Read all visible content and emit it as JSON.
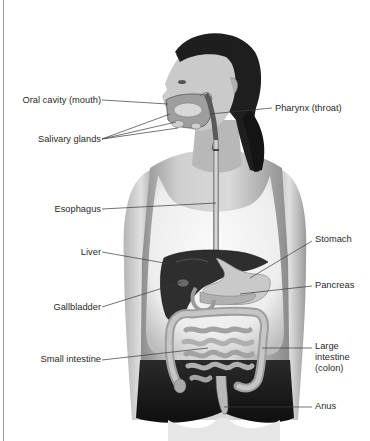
{
  "diagram": {
    "title": "",
    "colors": {
      "background": "#ffffff",
      "text": "#2a2a2a",
      "leader_line": "#3a3a3a",
      "skin": "#c9c9c9",
      "hair": "#1e1e1e",
      "tank_top": "#f2f2f2",
      "shorts": "#1a1a1a",
      "liver": "#2e2e2e",
      "organs": "#bdbdbd"
    },
    "labels": {
      "oral_cavity": "Oral cavity (mouth)",
      "pharynx": "Pharynx (throat)",
      "salivary_glands": "Salivary glands",
      "esophagus": "Esophagus",
      "stomach": "Stomach",
      "liver": "Liver",
      "pancreas": "Pancreas",
      "gallbladder": "Gallbladder",
      "large_intestine_line1": "Large",
      "large_intestine_line2": "intestine",
      "large_intestine_line3": "(colon)",
      "small_intestine": "Small intestine",
      "anus": "Anus"
    },
    "label_sides": {
      "left": [
        "Oral cavity (mouth)",
        "Salivary glands",
        "Esophagus",
        "Liver",
        "Gallbladder",
        "Small intestine"
      ],
      "right": [
        "Pharynx (throat)",
        "Stomach",
        "Pancreas",
        "Large intestine (colon)",
        "Anus"
      ]
    }
  }
}
